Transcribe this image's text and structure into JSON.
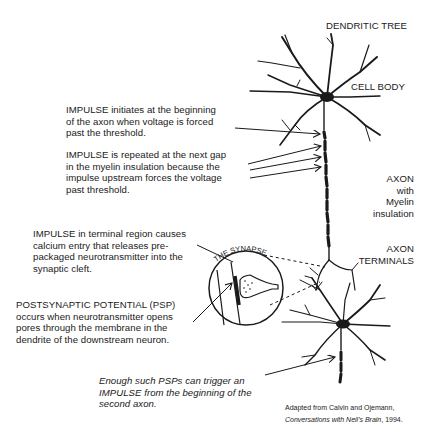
{
  "diagram": {
    "type": "neuron-signal-transmission",
    "labels": {
      "dendritic_tree": "DENDRITIC TREE",
      "cell_body": "CELL BODY",
      "axon_line1": "AXON",
      "axon_line2": "with",
      "axon_line3": "Myelin",
      "axon_line4": "insulation",
      "axon_terminals_line1": "AXON",
      "axon_terminals_line2": "TERMINALS",
      "synapse": "THE SYNAPSE"
    },
    "annotations": [
      {
        "lines": [
          "IMPULSE initiates at the beginning",
          "of the axon when voltage is forced",
          "past the threshold."
        ]
      },
      {
        "lines": [
          "IMPULSE is repeated at the next gap",
          "in the myelin insulation because the",
          "impulse upstream forces the voltage",
          "past threshold."
        ]
      },
      {
        "lines": [
          "IMPULSE in terminal region causes",
          "calcium entry that releases pre-",
          "packaged neurotransmitter into the",
          "synaptic cleft."
        ]
      },
      {
        "lines": [
          "POSTSYNAPTIC POTENTIAL (PSP)",
          "occurs when neurotransmitter opens",
          "pores through the membrane in the",
          "dendrite of the downstream neuron."
        ]
      },
      {
        "lines": [
          "Enough such PSPs can trigger an",
          "IMPULSE from the beginning of the",
          "second axon."
        ]
      }
    ],
    "credit": {
      "line1": "Adapted from Calvin and Ojemann,",
      "line2_title": "Conversations with Neil's Brain",
      "line2_rest": ", 1994."
    },
    "colors": {
      "ink": "#1a1a1a",
      "background": "#ffffff"
    }
  }
}
